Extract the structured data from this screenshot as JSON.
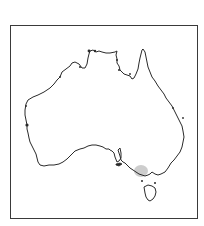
{
  "map": {
    "subject": "Australia",
    "style": "outline map, black coastline on white",
    "frame": {
      "border_color": "#3a3a3a",
      "background": "#ffffff"
    },
    "coastline_color": "#2a2a2a",
    "highlight": {
      "region": "south-east coast near Melbourne / Port Phillip (Victoria)",
      "color": "#c8c8c8",
      "shape": "ellipse"
    },
    "features": [
      "mainland Australia",
      "Tasmania",
      "Kangaroo Island",
      "Spencer Gulf",
      "Gulf of St Vincent",
      "Cape York Peninsula",
      "Gulf of Carpentaria"
    ]
  }
}
